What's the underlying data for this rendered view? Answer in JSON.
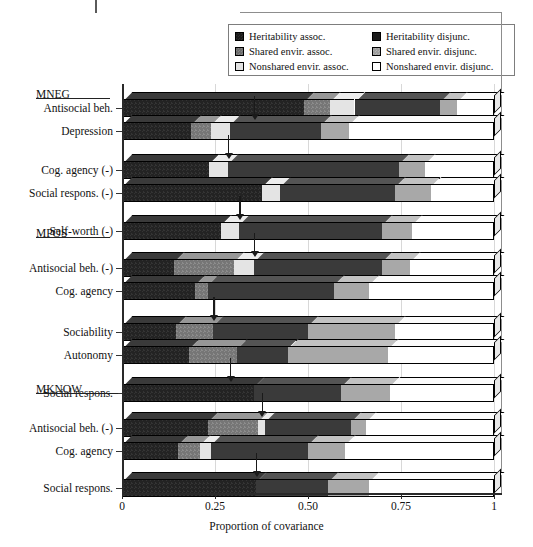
{
  "legend": {
    "rows": [
      [
        {
          "swatch": "heritability-assoc-swatch",
          "label": "Heritability assoc."
        },
        {
          "swatch": "heritability-disjunc-swatch",
          "label": "Heritability disjunc."
        }
      ],
      [
        {
          "swatch": "shared-envir-assoc-swatch",
          "label": "Shared envir. assoc."
        },
        {
          "swatch": "shared-envir-disjunc-swatch",
          "label": "Shared envir. disjunc."
        }
      ],
      [
        {
          "swatch": "nonshared-envir-assoc-swatch",
          "label": "Nonshared envir. assoc."
        },
        {
          "swatch": "nonshared-envir-disjunc-swatch",
          "label": "Nonshared envir. disjunc."
        }
      ]
    ]
  },
  "axis": {
    "title": "Proportion of covariance",
    "ticks": [
      "0",
      "0.25",
      "0.50",
      "0.75",
      "1"
    ],
    "tick_values": [
      0,
      0.25,
      0.5,
      0.75,
      1
    ],
    "range": [
      0,
      1
    ]
  },
  "groups": [
    {
      "name": "MNEG",
      "y": 88
    },
    {
      "name": "MPOS",
      "y": 227
    },
    {
      "name": "MKNOW",
      "y": 383
    }
  ],
  "chart_data": {
    "type": "bar",
    "orientation": "horizontal",
    "stacked": true,
    "title": "",
    "xlabel": "Proportion of covariance",
    "ylabel": "",
    "xlim": [
      0,
      1
    ],
    "grid": false,
    "legend_position": "top-right",
    "series": [
      {
        "name": "Heritability assoc.",
        "key": "her_a",
        "color": "#232323"
      },
      {
        "name": "Shared envir. assoc.",
        "key": "she_a",
        "color": "#767676"
      },
      {
        "name": "Nonshared envir. assoc.",
        "key": "non_a",
        "color": "#e4e4e4"
      },
      {
        "name": "Heritability disjunc.",
        "key": "her_d",
        "color": "#3a3a3a"
      },
      {
        "name": "Shared envir. disjunc.",
        "key": "she_d",
        "color": "#a8a8a8"
      },
      {
        "name": "Nonshared envir. disjunc.",
        "key": "non_d",
        "color": "#ffffff"
      }
    ],
    "categories": [
      "Antisocial beh.",
      "Depression",
      "Cog. agency (-)",
      "Social respons. (-)",
      "Self-worth (-)",
      "Antisocial beh. (-)",
      "Cog. agency",
      "Sociability",
      "Autonomy",
      "Social respons.",
      "Antisocial beh. (-)",
      "Cog. agency",
      "Social respons."
    ],
    "bars": [
      {
        "label": "Antisocial beh.",
        "group": "MNEG",
        "marker": null,
        "segments": [
          {
            "key": "her_a",
            "value": 0.49
          },
          {
            "key": "she_a",
            "value": 0.07
          },
          {
            "key": "non_a",
            "value": 0.065
          },
          {
            "key": "her_d",
            "value": 0.23
          },
          {
            "key": "she_d",
            "value": 0.045
          },
          {
            "key": "non_d",
            "value": 0.1
          }
        ]
      },
      {
        "label": "Depression",
        "group": "MNEG",
        "marker": 0.355,
        "segments": [
          {
            "key": "her_a",
            "value": 0.185
          },
          {
            "key": "she_a",
            "value": 0.055
          },
          {
            "key": "non_a",
            "value": 0.05
          },
          {
            "key": "her_d",
            "value": 0.245
          },
          {
            "key": "she_d",
            "value": 0.075
          },
          {
            "key": "non_d",
            "value": 0.39
          }
        ]
      },
      {
        "label": "Cog. agency (-)",
        "group": "MNEG",
        "marker": 0.285,
        "segments": [
          {
            "key": "her_a",
            "value": 0.235
          },
          {
            "key": "she_a",
            "value": 0.0
          },
          {
            "key": "non_a",
            "value": 0.05
          },
          {
            "key": "her_d",
            "value": 0.46
          },
          {
            "key": "she_d",
            "value": 0.07
          },
          {
            "key": "non_d",
            "value": 0.185
          }
        ]
      },
      {
        "label": "Social respons. (-)",
        "group": "MNEG",
        "marker": null,
        "segments": [
          {
            "key": "her_a",
            "value": 0.375
          },
          {
            "key": "she_a",
            "value": 0.0
          },
          {
            "key": "non_a",
            "value": 0.05
          },
          {
            "key": "her_d",
            "value": 0.31
          },
          {
            "key": "she_d",
            "value": 0.095
          },
          {
            "key": "non_d",
            "value": 0.17
          }
        ]
      },
      {
        "label": "Self-worth (-)",
        "group": "MNEG",
        "marker": 0.315,
        "segments": [
          {
            "key": "her_a",
            "value": 0.265
          },
          {
            "key": "she_a",
            "value": 0.0
          },
          {
            "key": "non_a",
            "value": 0.05
          },
          {
            "key": "her_d",
            "value": 0.385
          },
          {
            "key": "she_d",
            "value": 0.08
          },
          {
            "key": "non_d",
            "value": 0.22
          }
        ]
      },
      {
        "label": "Antisocial beh. (-)",
        "group": "MPOS",
        "marker": 0.355,
        "segments": [
          {
            "key": "her_a",
            "value": 0.14
          },
          {
            "key": "she_a",
            "value": 0.16
          },
          {
            "key": "non_a",
            "value": 0.055
          },
          {
            "key": "her_d",
            "value": 0.345
          },
          {
            "key": "she_d",
            "value": 0.075
          },
          {
            "key": "non_d",
            "value": 0.225
          }
        ]
      },
      {
        "label": "Cog. agency",
        "group": "MPOS",
        "marker": null,
        "segments": [
          {
            "key": "her_a",
            "value": 0.195
          },
          {
            "key": "she_a",
            "value": 0.035
          },
          {
            "key": "non_a",
            "value": 0.0
          },
          {
            "key": "her_d",
            "value": 0.34
          },
          {
            "key": "she_d",
            "value": 0.095
          },
          {
            "key": "non_d",
            "value": 0.335
          }
        ]
      },
      {
        "label": "Sociability",
        "group": "MPOS",
        "marker": 0.245,
        "segments": [
          {
            "key": "her_a",
            "value": 0.145
          },
          {
            "key": "she_a",
            "value": 0.1
          },
          {
            "key": "non_a",
            "value": 0.0
          },
          {
            "key": "her_d",
            "value": 0.255
          },
          {
            "key": "she_d",
            "value": 0.235
          },
          {
            "key": "non_d",
            "value": 0.265
          }
        ]
      },
      {
        "label": "Autonomy",
        "group": "MPOS",
        "marker": null,
        "segments": [
          {
            "key": "her_a",
            "value": 0.18
          },
          {
            "key": "she_a",
            "value": 0.13
          },
          {
            "key": "non_a",
            "value": 0.0
          },
          {
            "key": "her_d",
            "value": 0.135
          },
          {
            "key": "she_d",
            "value": 0.27
          },
          {
            "key": "non_d",
            "value": 0.285
          }
        ]
      },
      {
        "label": "Social respons.",
        "group": "MPOS",
        "marker": 0.29,
        "segments": [
          {
            "key": "her_a",
            "value": 0.355
          },
          {
            "key": "she_a",
            "value": 0.0
          },
          {
            "key": "non_a",
            "value": 0.0
          },
          {
            "key": "her_d",
            "value": 0.235
          },
          {
            "key": "she_d",
            "value": 0.13
          },
          {
            "key": "non_d",
            "value": 0.28
          }
        ]
      },
      {
        "label": "Antisocial beh. (-)",
        "group": "MKNOW",
        "marker": 0.375,
        "segments": [
          {
            "key": "her_a",
            "value": 0.23
          },
          {
            "key": "she_a",
            "value": 0.135
          },
          {
            "key": "non_a",
            "value": 0.02
          },
          {
            "key": "her_d",
            "value": 0.23
          },
          {
            "key": "she_d",
            "value": 0.04
          },
          {
            "key": "non_d",
            "value": 0.345
          }
        ]
      },
      {
        "label": "Cog. agency",
        "group": "MKNOW",
        "marker": null,
        "segments": [
          {
            "key": "her_a",
            "value": 0.15
          },
          {
            "key": "she_a",
            "value": 0.06
          },
          {
            "key": "non_a",
            "value": 0.03
          },
          {
            "key": "her_d",
            "value": 0.26
          },
          {
            "key": "she_d",
            "value": 0.1
          },
          {
            "key": "non_d",
            "value": 0.4
          }
        ]
      },
      {
        "label": "Social respons.",
        "group": "MKNOW",
        "marker": 0.36,
        "segments": [
          {
            "key": "her_a",
            "value": 0.36
          },
          {
            "key": "she_a",
            "value": 0.0
          },
          {
            "key": "non_a",
            "value": 0.0
          },
          {
            "key": "her_d",
            "value": 0.195
          },
          {
            "key": "she_d",
            "value": 0.11
          },
          {
            "key": "non_d",
            "value": 0.335
          }
        ]
      }
    ]
  },
  "layout": {
    "bar_rows": [
      {
        "bar": 0,
        "y": 99
      },
      {
        "bar": 1,
        "y": 122
      },
      {
        "bar": 2,
        "y": 161
      },
      {
        "bar": 3,
        "y": 184
      },
      {
        "bar": 4,
        "y": 222
      },
      {
        "bar": 5,
        "y": 259
      },
      {
        "bar": 6,
        "y": 282
      },
      {
        "bar": 7,
        "y": 323
      },
      {
        "bar": 8,
        "y": 346
      },
      {
        "bar": 9,
        "y": 384
      },
      {
        "bar": 10,
        "y": 419
      },
      {
        "bar": 11,
        "y": 442
      },
      {
        "bar": 12,
        "y": 479
      }
    ],
    "group_heads": [
      {
        "name": "MNEG",
        "y": 88,
        "rule_y": 98,
        "rule_w": 74
      },
      {
        "name": "MPOS",
        "y": 227,
        "rule_y": 237,
        "rule_w": 74
      },
      {
        "name": "MKNOW",
        "y": 383,
        "rule_y": 393,
        "rule_w": 82
      }
    ]
  }
}
